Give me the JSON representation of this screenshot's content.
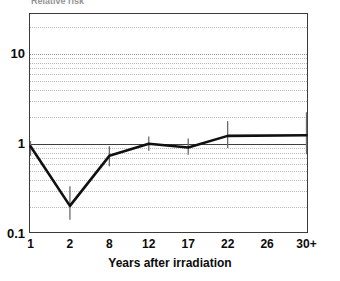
{
  "chart_data": {
    "type": "line",
    "title": "Relative risk",
    "ylabel": "Relative risk",
    "xlabel": "Years after irradiation",
    "categories": [
      "1",
      "2",
      "8",
      "12",
      "17",
      "22",
      "26",
      "30+"
    ],
    "x_tick_labels": [
      "1",
      "2",
      "8",
      "12",
      "17",
      "22",
      "26",
      "30+"
    ],
    "y_tick_labels": [
      "10",
      "1",
      "0.1"
    ],
    "y_tick_values": [
      10,
      1,
      0.1
    ],
    "yscale": "log",
    "ylim": [
      0.1,
      22
    ],
    "grid": "dotted-minor-and-major",
    "legend": "none",
    "reference_line": 1,
    "values": [
      0.92,
      0.2,
      0.72,
      0.98,
      0.89,
      1.2,
      null,
      1.22
    ],
    "series": [
      {
        "name": "Relative risk",
        "points": [
          {
            "x": "1",
            "y": 0.92,
            "err_low": 0.72,
            "err_high": 1.05
          },
          {
            "x": "2",
            "y": 0.2,
            "err_low": 0.14,
            "err_high": 0.33
          },
          {
            "x": "8",
            "y": 0.72,
            "err_low": 0.55,
            "err_high": 0.92
          },
          {
            "x": "12",
            "y": 0.98,
            "err_low": 0.82,
            "err_high": 1.18
          },
          {
            "x": "17",
            "y": 0.89,
            "err_low": 0.74,
            "err_high": 1.12
          },
          {
            "x": "22",
            "y": 1.2,
            "err_low": 0.88,
            "err_high": 1.75
          },
          {
            "x": "30+",
            "y": 1.22,
            "err_low": 0.75,
            "err_high": 2.2
          }
        ]
      }
    ],
    "colors": {
      "line": "#101010",
      "errorbar": "#6b6b6b",
      "grid": "#b9b9b9",
      "axis": "#3b3b3b",
      "text": "#0b0b0b"
    }
  }
}
